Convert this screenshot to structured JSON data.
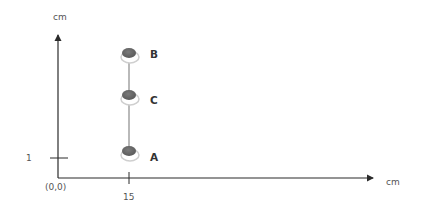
{
  "diagram": {
    "y_axis_unit": "cm",
    "x_axis_unit": "cm",
    "origin_label": "(0,0)",
    "y_tick_label": "1",
    "x_tick_label": "15",
    "points": [
      {
        "label": "B"
      },
      {
        "label": "C"
      },
      {
        "label": "A"
      }
    ],
    "colors": {
      "axis": "#2b2b2b",
      "marker_fill": "#6b6b6b",
      "marker_ring": "#d9d9d9",
      "connector": "#8a8a8a"
    }
  }
}
